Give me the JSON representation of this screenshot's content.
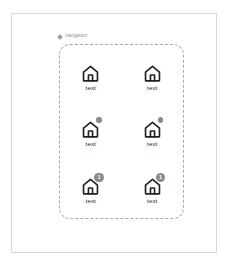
{
  "canvas": {
    "background_color": "#ffffff",
    "frame_color": "#d8d8d8"
  },
  "annotation": {
    "marker_icon": "diamond-marker-icon",
    "label": "navigation",
    "color": "#8d8d8d"
  },
  "nav_container": {
    "border_style": "dashed",
    "border_color": "#a8a8a8",
    "columns": 2,
    "rows": 3
  },
  "colors": {
    "icon_stroke": "#222222",
    "badge_background": "#8a8a8a",
    "badge_text": "#ffffff",
    "label_text": "#2b2b2b"
  },
  "nav_items": [
    {
      "id": "nav-item-1",
      "icon": "home-icon",
      "label": "text",
      "badge_type": "none",
      "badge_value": ""
    },
    {
      "id": "nav-item-2",
      "icon": "home-icon",
      "label": "text",
      "badge_type": "none",
      "badge_value": ""
    },
    {
      "id": "nav-item-3",
      "icon": "home-icon",
      "label": "text",
      "badge_type": "dot",
      "badge_value": ""
    },
    {
      "id": "nav-item-4",
      "icon": "home-icon",
      "label": "text",
      "badge_type": "dot",
      "badge_value": ""
    },
    {
      "id": "nav-item-5",
      "icon": "home-icon",
      "label": "text",
      "badge_type": "count",
      "badge_value": "1"
    },
    {
      "id": "nav-item-6",
      "icon": "home-icon",
      "label": "text",
      "badge_type": "count",
      "badge_value": "1"
    }
  ]
}
